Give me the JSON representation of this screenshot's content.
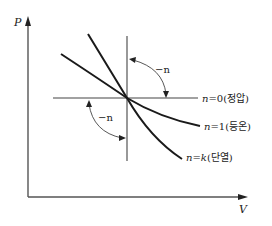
{
  "diagram": {
    "type": "P-V polytropic process diagram",
    "axes": {
      "y_label": "P",
      "x_label": "V"
    },
    "annotations": {
      "upper_angle_label": "−n",
      "lower_angle_label": "−n"
    },
    "curves": [
      {
        "id": "n0",
        "prefix": "n",
        "eq": "=0",
        "korean": "(정압)",
        "meaning": "constant pressure"
      },
      {
        "id": "n1",
        "prefix": "n",
        "eq": "=1",
        "korean": "(등온)",
        "meaning": "isothermal"
      },
      {
        "id": "nk",
        "prefix": "n",
        "eq_var": "k",
        "eq": "=",
        "korean": "(단열)",
        "meaning": "adiabatic"
      }
    ]
  }
}
